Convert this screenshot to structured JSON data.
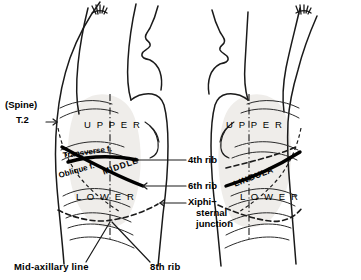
{
  "figure": {
    "background_color": "#ffffff",
    "ink_color": "#111111",
    "lung_fill_color": "#efedea",
    "fissure_color": "#000000"
  },
  "right_lateral": {
    "name": "right lateral chest view",
    "zones": {
      "upper": "U P P E R",
      "middle": "MIDDLE",
      "lower": "L O W E R"
    },
    "fissures": {
      "transverse": "Transverse f.",
      "oblique": "Oblique f."
    },
    "spine_label": {
      "line1": "(Spine)",
      "line2": "T.2",
      "arrow": "→"
    }
  },
  "left_lateral": {
    "name": "left lateral chest view",
    "zones": {
      "upper": "U P P E R",
      "lingula": "LINGULA",
      "lower": "L O W E R"
    }
  },
  "callouts": {
    "rib4": "4th rib",
    "rib6": "6th rib",
    "rib6_arrow": "←",
    "xiphi_line1": "Xiphi−",
    "xiphi_line2": "sternal",
    "xiphi_line3": "junction",
    "xiphi_arrow": "←"
  },
  "bottom_labels": {
    "mid_axillary": "Mid-axillary line",
    "rib8": "8th rib"
  }
}
